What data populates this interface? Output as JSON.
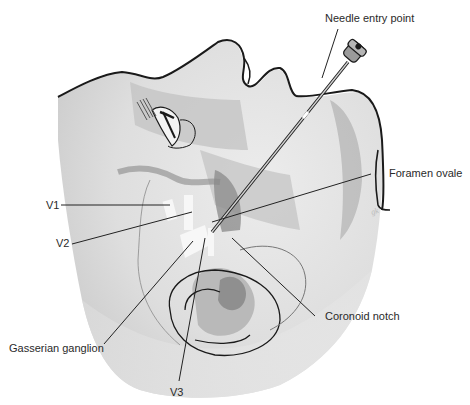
{
  "figure": {
    "labels": {
      "needle_entry_point": "Needle entry point",
      "foramen_ovale": "Foramen ovale",
      "v1": "V1",
      "v2": "V2",
      "gasserian_ganglion": "Gasserian ganglion",
      "coronoid_notch": "Coronoid notch",
      "v3": "V3"
    },
    "colors": {
      "outline": "#1a1a1a",
      "skin_light": "#e6e6e6",
      "skin_mid": "#cfcfcf",
      "shadow": "#a9a9a9",
      "dark": "#7d7d7d",
      "nerve": "#f5f5f5",
      "leader": "#222222"
    }
  }
}
